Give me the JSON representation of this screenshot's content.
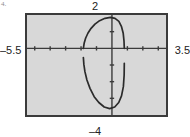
{
  "figure": {
    "label": "4.",
    "kind": "graphing-calculator-screen"
  },
  "window": {
    "xmin_label": "–5.5",
    "xmax_label": "3.5",
    "ymax_label": "2",
    "ymin_label": "–4"
  },
  "colors": {
    "screen_background": "#d8d8d8",
    "screen_border": "#3b3b3b",
    "axis": "#3b3b3b",
    "curve": "#2b2b2b",
    "label_text": "#222222",
    "figure_label_text": "#8e8e8e",
    "page_background": "#ffffff"
  },
  "chart_data": {
    "type": "line",
    "title": "",
    "xlabel": "",
    "ylabel": "",
    "xlim": [
      -5.5,
      3.5
    ],
    "ylim": [
      -4,
      2
    ],
    "grid": false,
    "legend": null,
    "x_tick_spacing": 1,
    "y_tick_spacing": 1,
    "x_ticks": [
      -5,
      -4,
      -3,
      -2,
      -1,
      0,
      1,
      2,
      3
    ],
    "y_ticks": [
      -3,
      -2,
      -1,
      0,
      1
    ],
    "axes": {
      "x_axis_at_y": 0,
      "y_axis_at_x": 0
    },
    "series": [
      {
        "name": "upper-arc",
        "comment": "upper semicircular arc of a closed oval; endpoints sit on the x-axis",
        "x": [
          -1.85,
          -1.8,
          -1.7,
          -1.55,
          -1.35,
          -1.1,
          -0.8,
          -0.45,
          -0.1,
          0.2,
          0.45,
          0.62,
          0.73,
          0.78,
          0.8
        ],
        "y": [
          0.0,
          0.3,
          0.62,
          0.92,
          1.2,
          1.45,
          1.66,
          1.8,
          1.86,
          1.8,
          1.62,
          1.3,
          0.9,
          0.45,
          0.0
        ]
      },
      {
        "name": "lower-arc",
        "comment": "lower arc of the closed oval; endpoints sit near the x-axis, vertex near y = -3.6",
        "x": [
          -1.85,
          -1.82,
          -1.75,
          -1.62,
          -1.42,
          -1.15,
          -0.85,
          -0.5,
          -0.15,
          0.18,
          0.44,
          0.62,
          0.74,
          0.79,
          0.8
        ],
        "y": [
          -0.55,
          -0.95,
          -1.4,
          -1.9,
          -2.4,
          -2.9,
          -3.25,
          -3.52,
          -3.62,
          -3.52,
          -3.25,
          -2.85,
          -2.3,
          -1.6,
          -0.9
        ]
      }
    ]
  }
}
